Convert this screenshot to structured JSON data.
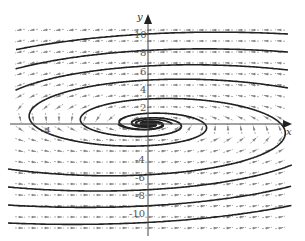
{
  "chart_data": {
    "type": "direction-field",
    "title": "",
    "xlabel": "x",
    "ylabel": "y",
    "xlim": [
      -7,
      7
    ],
    "ylim": [
      -12,
      12
    ],
    "grid": false,
    "x_tick_labels": [
      "-4"
    ],
    "y_tick_labels": [
      "10",
      "8",
      "6",
      "4",
      "2",
      "-4",
      "-6",
      "-8",
      "-10"
    ],
    "equilibrium": {
      "x": 0,
      "y": 0,
      "kind": "stable spiral"
    }
  },
  "axes": {
    "x_label": "x",
    "y_label": "y",
    "x_ticks": [
      {
        "label": "-4",
        "px": 45
      }
    ],
    "y_ticks": [
      {
        "label": "10",
        "py": 35
      },
      {
        "label": "8",
        "py": 53
      },
      {
        "label": "6",
        "py": 72
      },
      {
        "label": "4",
        "py": 90
      },
      {
        "label": "2",
        "py": 108
      },
      {
        "label": "-4",
        "py": 160
      },
      {
        "label": "-6",
        "py": 178
      },
      {
        "label": "-8",
        "py": 196
      },
      {
        "label": "-10",
        "py": 214
      }
    ]
  },
  "colors": {
    "curve": "#222222",
    "arrow": "#888888",
    "axis": "#444444"
  }
}
